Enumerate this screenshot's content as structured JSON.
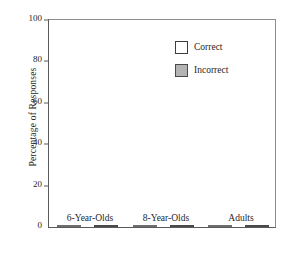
{
  "chart_data": {
    "type": "bar",
    "title": "",
    "xlabel": "",
    "ylabel": "Percentage of Responses",
    "categories": [
      "6-Year-Olds",
      "8-Year-Olds",
      "Adults"
    ],
    "series": [
      {
        "name": "Correct",
        "color": "#ffffff",
        "values": [
          82,
          75,
          55
        ]
      },
      {
        "name": "Incorrect",
        "color": "#b4b4b4",
        "values": [
          10,
          22,
          28
        ]
      }
    ],
    "ylim": [
      0,
      100
    ],
    "yticks": [
      0,
      20,
      40,
      60,
      80,
      100
    ],
    "ytick_labels": [
      "0",
      "20",
      "40",
      "60",
      "80",
      "100"
    ],
    "grid": false,
    "legend_position": "top-right",
    "legend_entries": [
      "Correct",
      "Incorrect"
    ]
  }
}
